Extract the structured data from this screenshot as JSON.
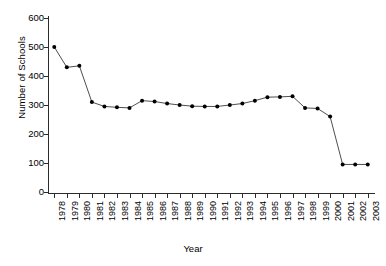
{
  "chart_data": {
    "type": "line",
    "title": "",
    "xlabel": "Year",
    "ylabel": "Number of Schools",
    "xlim": [
      1977.4,
      2003.6
    ],
    "ylim": [
      0,
      600
    ],
    "yticks": [
      0,
      100,
      200,
      300,
      400,
      500,
      600
    ],
    "grid": false,
    "legend": null,
    "marker": "filled-circle",
    "line_color": "#3a3a3a",
    "marker_color": "#000000",
    "categories": [
      "1978",
      "1979",
      "1980",
      "1981",
      "1982",
      "1983",
      "1984",
      "1985",
      "1986",
      "1987",
      "1988",
      "1989",
      "1990",
      "1991",
      "1992",
      "1993",
      "1994",
      "1995",
      "1996",
      "1997",
      "1998",
      "1999",
      "2000",
      "2001",
      "2002",
      "2003"
    ],
    "values": [
      500,
      430,
      435,
      310,
      295,
      292,
      290,
      315,
      312,
      305,
      300,
      296,
      295,
      295,
      300,
      305,
      315,
      327,
      328,
      330,
      290,
      288,
      260,
      95,
      95,
      95
    ]
  },
  "axes": {
    "y_tick_labels": [
      "600",
      "500",
      "400",
      "300",
      "200",
      "100",
      "0"
    ],
    "x_tick_labels": [
      "1978",
      "1979",
      "1980",
      "1981",
      "1982",
      "1983",
      "1984",
      "1985",
      "1986",
      "1987",
      "1988",
      "1989",
      "1990",
      "1991",
      "1992",
      "1993",
      "1994",
      "1995",
      "1996",
      "1997",
      "1998",
      "1999",
      "2000",
      "2001",
      "2002",
      "2003"
    ]
  }
}
